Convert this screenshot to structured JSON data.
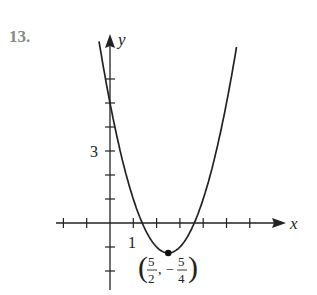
{
  "problem_number": "13.",
  "chart_data": {
    "type": "line",
    "title": "",
    "function": "y = x^2 - 5x + 5",
    "xlabel": "x",
    "ylabel": "y",
    "x_tick_labels": [
      {
        "value": 1,
        "label": "1"
      }
    ],
    "y_tick_labels": [
      {
        "value": 3,
        "label": "3"
      }
    ],
    "x_ticks": [
      -2,
      -1,
      1,
      2,
      3,
      4,
      5,
      6
    ],
    "y_ticks": [
      -2,
      -1,
      1,
      2,
      3,
      4,
      5,
      6
    ],
    "xlim": [
      -2.2,
      8
    ],
    "ylim": [
      -2.5,
      7.5
    ],
    "grid": false,
    "vertex": {
      "x": 2.5,
      "y": -1.25,
      "label_x_num": "5",
      "label_x_den": "2",
      "label_y_num": "5",
      "label_y_den": "4"
    },
    "annotations": [
      "(5/2, -5/4)"
    ]
  },
  "labels": {
    "x_axis": "x",
    "y_axis": "y",
    "tick_1": "1",
    "tick_3": "3"
  }
}
